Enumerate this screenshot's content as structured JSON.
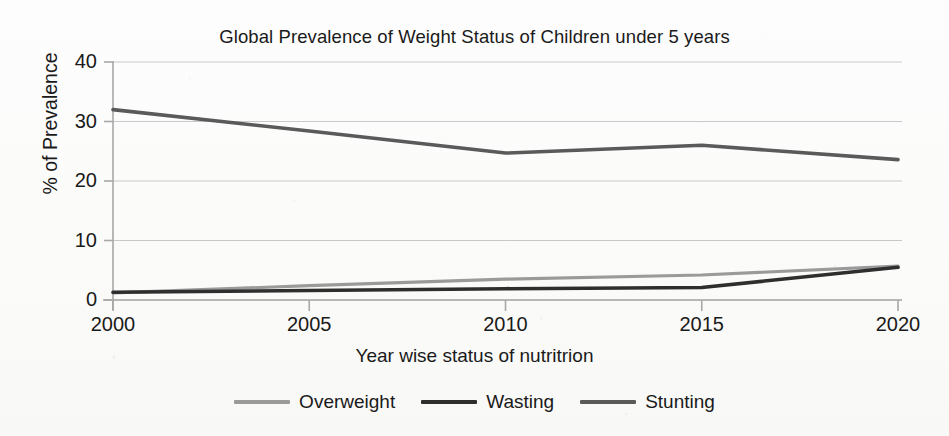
{
  "chart_data": {
    "type": "line",
    "title": "Global Prevalence of Weight Status of Children under 5 years",
    "xlabel": "Year wise status of nutritrion",
    "ylabel": "% of Prevalence",
    "categories": [
      "2000",
      "2005",
      "2010",
      "2015",
      "2020"
    ],
    "x": [
      2000,
      2005,
      2010,
      2015,
      2020
    ],
    "xlim": [
      2000,
      2020
    ],
    "ylim": [
      0,
      40
    ],
    "yticks": [
      0,
      10,
      20,
      30,
      40
    ],
    "xticks": [
      2000,
      2005,
      2010,
      2015,
      2020
    ],
    "grid": true,
    "grid_axis": "y",
    "legend_position": "bottom",
    "series": [
      {
        "name": "Overweight",
        "color": "#9a9a9a",
        "values": [
          1.2,
          2.4,
          3.5,
          4.2,
          5.7
        ]
      },
      {
        "name": "Wasting",
        "color": "#2e2e2e",
        "values": [
          1.3,
          1.6,
          1.9,
          2.1,
          5.5
        ]
      },
      {
        "name": "Stunting",
        "color": "#5a5a5a",
        "values": [
          32.0,
          28.4,
          24.7,
          26.0,
          23.6
        ]
      }
    ]
  },
  "axes": {
    "y_tick_labels": [
      "40",
      "30",
      "20",
      "10",
      "0"
    ],
    "x_tick_labels": [
      "2000",
      "2005",
      "2010",
      "2015",
      "2020"
    ]
  },
  "legend": {
    "items": [
      {
        "label": "Overweight",
        "color": "#9a9a9a"
      },
      {
        "label": "Wasting",
        "color": "#2e2e2e"
      },
      {
        "label": "Stunting",
        "color": "#5a5a5a"
      }
    ]
  }
}
